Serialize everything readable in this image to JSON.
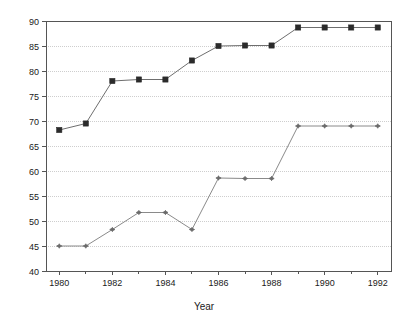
{
  "chart_data": {
    "type": "line",
    "title": "",
    "subtitle": "",
    "xlabel": "Year",
    "ylabel": "",
    "x": [
      1980,
      1981,
      1982,
      1983,
      1984,
      1985,
      1986,
      1987,
      1988,
      1989,
      1990,
      1991,
      1992
    ],
    "xlim": [
      1979.5,
      1992.5
    ],
    "ylim": [
      40,
      90
    ],
    "ytick_values": [
      40,
      45,
      50,
      55,
      60,
      65,
      70,
      75,
      80,
      85,
      90
    ],
    "ytick_labels": [
      "40",
      "45",
      "50",
      "55",
      "60",
      "65",
      "70",
      "75",
      "80",
      "85",
      "90"
    ],
    "xtick_values": [
      1980,
      1982,
      1984,
      1986,
      1988,
      1990,
      1992
    ],
    "xtick_labels": [
      "1980",
      "1982",
      "1984",
      "1986",
      "1988",
      "1990",
      "1992"
    ],
    "xtick_minor_values": [
      1981,
      1983,
      1985,
      1987,
      1989,
      1991
    ],
    "grid": "horizontal",
    "grid_color": "#b9b9b9",
    "legend": "none",
    "frame": true,
    "series": [
      {
        "name": "upper",
        "marker": "square",
        "marker_color": "#2b2b2b",
        "line_color": "#6e6e6e",
        "values": [
          68.2,
          69.5,
          78.0,
          78.3,
          78.3,
          82.1,
          85.0,
          85.1,
          85.1,
          88.7,
          88.7,
          88.7,
          88.7
        ]
      },
      {
        "name": "lower",
        "marker": "diamond",
        "marker_color": "#6b6b6b",
        "line_color": "#8a8a8a",
        "values": [
          45.0,
          45.0,
          48.3,
          51.7,
          51.7,
          48.3,
          58.6,
          58.5,
          58.5,
          69.0,
          69.0,
          69.0,
          69.0
        ]
      }
    ]
  },
  "colors": {
    "background": "#ffffff",
    "axis": "#555555",
    "text": "#1a1a1a"
  }
}
